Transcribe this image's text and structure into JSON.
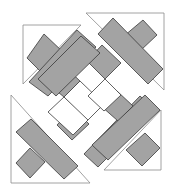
{
  "diagram": {
    "title": "Quilt block exploded assembly diagram",
    "width": 184,
    "height": 194,
    "colors": {
      "background": "#ffffff",
      "gray_fabric": "#a3a3a3",
      "white_fabric": "#ffffff",
      "piece_outline": "#3a3a3a",
      "triangle_outline": "#8a8a8a"
    },
    "triangles": [
      {
        "name": "triangle-top-left",
        "points": "23,25 81,25 23,84"
      },
      {
        "name": "triangle-top-right",
        "points": "86,13 164,13 164,90"
      },
      {
        "name": "triangle-bottom-left",
        "points": "11,95 11,183 90,183"
      },
      {
        "name": "triangle-bottom-right",
        "points": "161,110 161,170 104,170"
      }
    ],
    "pieces": [
      {
        "name": "tl-square",
        "fill": "gray",
        "points": "44,34 63,52 42,73 27,58"
      },
      {
        "name": "tl-long-bar",
        "fill": "gray",
        "points": "77,30 96,47 48,96 29,82"
      },
      {
        "name": "tr-square",
        "fill": "gray",
        "points": "143,20 157,35 140,51 124,36"
      },
      {
        "name": "tr-long-bar",
        "fill": "gray",
        "points": "113,18 163,69 148,84 98,34"
      },
      {
        "name": "bl-square",
        "fill": "gray",
        "points": "30,148 45,162 30,178 16,163"
      },
      {
        "name": "bl-long-bar",
        "fill": "gray",
        "points": "31,119 78,166 64,179 16,132"
      },
      {
        "name": "br-square",
        "fill": "gray",
        "points": "145,133 160,148 142,166 126,150"
      },
      {
        "name": "br-long-bar",
        "fill": "gray",
        "points": "155,110 113,152 98,167 84,154 140,96"
      },
      {
        "name": "center-gray-1",
        "fill": "gray",
        "points": "64,66 80,81 64,97 47,83"
      },
      {
        "name": "center-gray-2",
        "fill": "gray",
        "points": "102,45 121,63 105,79 87,61"
      },
      {
        "name": "center-gray-3",
        "fill": "gray",
        "points": "117,91 133,106 118,121 101,106"
      },
      {
        "name": "center-gray-4",
        "fill": "gray",
        "points": "73,108 89,124 72,140 57,125"
      },
      {
        "name": "center-long-bar-1",
        "fill": "gray",
        "points": "81,36 100,53 56,96 38,79"
      },
      {
        "name": "center-long-bar-2",
        "fill": "gray",
        "points": "145,95 160,110 108,160 92,145"
      },
      {
        "name": "center-white-1",
        "fill": "white",
        "points": "80,81 104,104 87,121 64,97"
      },
      {
        "name": "center-white-2",
        "fill": "white",
        "points": "105,79 121,95 104,111 88,96"
      },
      {
        "name": "center-white-3",
        "fill": "white",
        "points": "64,97 88,120 73,135 48,112"
      }
    ]
  }
}
